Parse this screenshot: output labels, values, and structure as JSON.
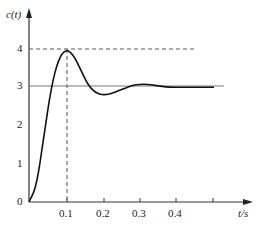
{
  "chart_data": {
    "type": "line",
    "title": "",
    "xlabel": "t/s",
    "ylabel": "c(t)",
    "x_ticks": [
      "0.1",
      "0.2",
      "0.3",
      "0.4"
    ],
    "y_ticks": [
      "0",
      "1",
      "2",
      "3",
      "4"
    ],
    "xlim": [
      0,
      0.5
    ],
    "ylim": [
      0,
      4.5
    ],
    "series": [
      {
        "name": "c(t)",
        "x": [
          0,
          0.02,
          0.04,
          0.06,
          0.08,
          0.1,
          0.12,
          0.14,
          0.16,
          0.18,
          0.2,
          0.22,
          0.24,
          0.26,
          0.28,
          0.3,
          0.32,
          0.34,
          0.36,
          0.38,
          0.4,
          0.45,
          0.5
        ],
        "values": [
          0,
          0.4,
          1.7,
          3.0,
          3.75,
          4.0,
          3.85,
          3.45,
          3.05,
          2.85,
          2.8,
          2.82,
          2.9,
          2.98,
          3.05,
          3.08,
          3.08,
          3.05,
          3.02,
          3.0,
          3.0,
          3.0,
          3.0
        ]
      }
    ],
    "annotations": [
      {
        "type": "hline",
        "y": 4,
        "style": "dashed",
        "label": "peak"
      },
      {
        "type": "vline",
        "x": 0.1,
        "style": "dashed",
        "label": "peak time"
      },
      {
        "type": "hline",
        "y": 3,
        "style": "solid",
        "label": "steady state"
      }
    ],
    "grid": false
  },
  "labels": {
    "ylabel": "c(t)",
    "xlabel": "t/s",
    "y0": "0",
    "y1": "1",
    "y2": "2",
    "y3": "3",
    "y4": "4",
    "x1": "0.1",
    "x2": "0.2",
    "x3": "0.3",
    "x4": "0.4"
  }
}
